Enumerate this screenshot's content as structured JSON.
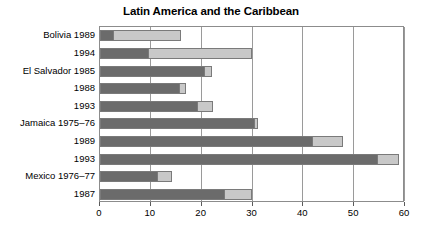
{
  "chart_data": {
    "type": "bar",
    "orientation": "horizontal",
    "stacked": true,
    "title": "Latin America and the Caribbean",
    "xlabel": "",
    "ylabel": "",
    "xlim": [
      0,
      60
    ],
    "ylim": null,
    "grid": "vertical",
    "legend": "none",
    "xticks": [
      0,
      10,
      20,
      30,
      40,
      50,
      60
    ],
    "xticklabels": [
      "0",
      "10",
      "20",
      "30",
      "40",
      "50",
      "60"
    ],
    "categories": [
      "Bolivia 1989",
      "1994",
      "El Salvador 1985",
      "1988",
      "1993",
      "Jamaica 1975–76",
      "1989",
      "1993",
      "Mexico 1976–77",
      "1987"
    ],
    "series": [
      {
        "name": "dark-segment",
        "color": "#6b6b6b",
        "values": [
          2.5,
          9.5,
          20.5,
          15.5,
          19.0,
          30.3,
          41.8,
          54.5,
          11.2,
          24.3
        ]
      },
      {
        "name": "light-segment",
        "color": "#c8c8c8",
        "values": [
          13.5,
          20.5,
          1.5,
          1.5,
          3.2,
          0.7,
          6.0,
          4.3,
          3.0,
          5.7
        ]
      }
    ],
    "totals": [
      16.0,
      30.0,
      22.0,
      17.0,
      22.2,
      31.0,
      47.8,
      58.8,
      14.2,
      30.0
    ]
  },
  "colors": {
    "dark": "#6b6b6b",
    "light": "#c8c8c8",
    "gridline": "#9a9a9a",
    "axis": "#8c8c8c",
    "text": "#000000",
    "background": "#ffffff"
  }
}
